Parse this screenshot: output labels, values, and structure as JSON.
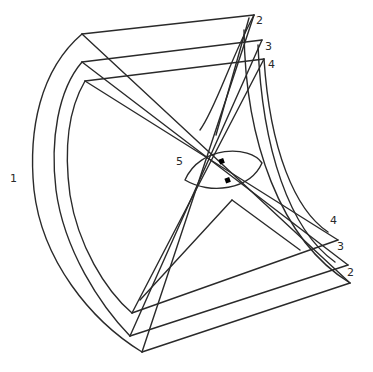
{
  "diagram": {
    "stroke_color": "#2a2a2a",
    "background": "#ffffff",
    "labels": [
      {
        "id": "label-1",
        "text": "1",
        "x": 10,
        "y": 176
      },
      {
        "id": "label-2-top",
        "text": "2",
        "x": 256,
        "y": 20
      },
      {
        "id": "label-3-top",
        "text": "3",
        "x": 265,
        "y": 44
      },
      {
        "id": "label-4-top",
        "text": "4",
        "x": 268,
        "y": 62
      },
      {
        "id": "label-5",
        "text": "5",
        "x": 176,
        "y": 158
      },
      {
        "id": "label-4-bottom",
        "text": "4",
        "x": 330,
        "y": 218
      },
      {
        "id": "label-3-bottom",
        "text": "3",
        "x": 337,
        "y": 242
      },
      {
        "id": "label-2-bottom",
        "text": "2",
        "x": 347,
        "y": 268
      }
    ]
  }
}
